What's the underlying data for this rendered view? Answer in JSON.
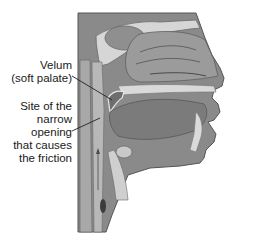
{
  "figure": {
    "labels": {
      "velum": {
        "lines": [
          "Velum",
          "(soft palate)"
        ]
      },
      "site": {
        "lines": [
          "Site of the",
          "narrow",
          "opening",
          "that causes",
          "the friction"
        ]
      }
    },
    "colors": {
      "background": "#ffffff",
      "tissue_dark": "#7a7a7a",
      "tissue_mid": "#959595",
      "bone_light": "#d9d9d9",
      "airway": "#c4c4c4",
      "outline": "#5a5a5a",
      "leader_line": "#222222"
    }
  }
}
